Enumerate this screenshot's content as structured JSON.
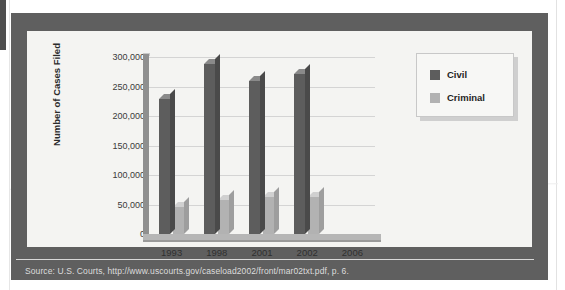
{
  "figure": {
    "source_note": "Source: U.S. Courts, http://www.uscourts.gov/caseload2002/front/mar02txt.pdf, p. 6.",
    "frame_color": "#5f5f5f",
    "panel_color": "#f4f4f2"
  },
  "chart_data": {
    "type": "bar",
    "title": "",
    "xlabel": "",
    "ylabel": "Number of Cases Filed",
    "categories": [
      "1993",
      "1998",
      "2001",
      "2002",
      "2006"
    ],
    "series": [
      {
        "name": "Civil",
        "color": "#5d5d5d",
        "values": [
          228000,
          288000,
          260000,
          272000,
          null
        ]
      },
      {
        "name": "Criminal",
        "color": "#b2b2b2",
        "values": [
          46000,
          57000,
          62000,
          62000,
          null
        ]
      }
    ],
    "ylim": [
      0,
      300000
    ],
    "ytick_values": [
      300000,
      250000,
      200000,
      150000,
      100000,
      50000,
      0
    ],
    "ytick_labels": [
      "300,000",
      "250,000",
      "200,000",
      "150,000",
      "100,000",
      "50,000",
      "0"
    ],
    "grid": true,
    "legend_position": "top-right",
    "legend_entries": [
      "Civil",
      "Criminal"
    ]
  }
}
